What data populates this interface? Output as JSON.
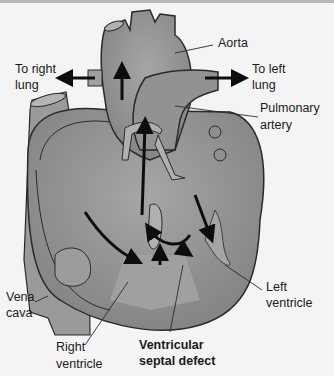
{
  "diagram": {
    "colors": {
      "background": "#f4f4f4",
      "heart_fill": "#8a8a8a",
      "heart_light": "#a8a8a8",
      "outline": "#2a2a2a",
      "arrow": "#0d0d0d"
    },
    "labels": {
      "aorta": "Aorta",
      "right_lung_1": "To right",
      "right_lung_2": "lung",
      "left_lung_1": "To left",
      "left_lung_2": "lung",
      "pulmonary_1": "Pulmonary",
      "pulmonary_2": "artery",
      "vena_1": "Vena",
      "vena_2": "cava",
      "left_v_1": "Left",
      "left_v_2": "ventricle",
      "right_v_1": "Right",
      "right_v_2": "ventricle",
      "vsd_1": "Ventricular",
      "vsd_2": "septal defect"
    }
  }
}
